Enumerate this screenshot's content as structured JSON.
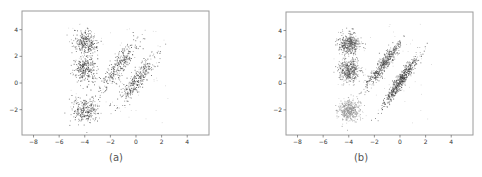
{
  "chart_data": [
    {
      "type": "scatter",
      "title": "",
      "caption": "(a)",
      "xlabel": "",
      "ylabel": "",
      "xlim": [
        -8.9,
        5.7
      ],
      "ylim": [
        -3.9,
        5.4
      ],
      "xticks": [
        -8,
        -6,
        -4,
        -2,
        0,
        2,
        4
      ],
      "yticks": [
        -2,
        0,
        2,
        4
      ],
      "grid": false,
      "legend": null,
      "point_color": "#333333",
      "clusters": [
        {
          "name": "blob-top",
          "center": [
            -4.0,
            3.0
          ],
          "std": [
            0.45,
            0.45
          ],
          "rho": 0.0,
          "n": 260
        },
        {
          "name": "blob-middle",
          "center": [
            -4.0,
            1.0
          ],
          "std": [
            0.45,
            0.5
          ],
          "rho": 0.0,
          "n": 260
        },
        {
          "name": "blob-bottom",
          "center": [
            -4.0,
            -2.0
          ],
          "std": [
            0.5,
            0.5
          ],
          "rho": 0.0,
          "n": 260
        },
        {
          "name": "diagonal-left",
          "center": [
            -1.3,
            1.4
          ],
          "std": [
            0.75,
            0.95
          ],
          "rho": 0.85,
          "n": 300
        },
        {
          "name": "diagonal-right",
          "center": [
            0.0,
            0.2
          ],
          "std": [
            0.75,
            1.0
          ],
          "rho": 0.88,
          "n": 320
        }
      ]
    },
    {
      "type": "scatter",
      "title": "",
      "caption": "(b)",
      "xlabel": "",
      "ylabel": "",
      "xlim": [
        -8.9,
        5.7
      ],
      "ylim": [
        -3.9,
        5.4
      ],
      "xticks": [
        -8,
        -6,
        -4,
        -2,
        0,
        2,
        4
      ],
      "yticks": [
        -2,
        0,
        2,
        4
      ],
      "grid": false,
      "legend": null,
      "clusters": [
        {
          "name": "blob-top",
          "center": [
            -4.0,
            3.0
          ],
          "std": [
            0.4,
            0.4
          ],
          "rho": 0.0,
          "n": 420,
          "color": "#555555"
        },
        {
          "name": "blob-middle",
          "center": [
            -4.0,
            1.0
          ],
          "std": [
            0.4,
            0.42
          ],
          "rho": 0.0,
          "n": 420,
          "color": "#555555"
        },
        {
          "name": "blob-bottom",
          "center": [
            -4.0,
            -2.0
          ],
          "std": [
            0.42,
            0.42
          ],
          "rho": 0.0,
          "n": 420,
          "color": "#8a8a8a"
        },
        {
          "name": "diagonal-left",
          "center": [
            -1.3,
            1.5
          ],
          "std": [
            0.65,
            0.85
          ],
          "rho": 0.93,
          "n": 480,
          "color": "#4a4a4a"
        },
        {
          "name": "diagonal-right",
          "center": [
            0.0,
            0.2
          ],
          "std": [
            0.65,
            0.9
          ],
          "rho": 0.94,
          "n": 560,
          "color": "#3a3a3a"
        }
      ]
    }
  ],
  "panels": {
    "a": {
      "caption": "(a)"
    },
    "b": {
      "caption": "(b)"
    }
  }
}
